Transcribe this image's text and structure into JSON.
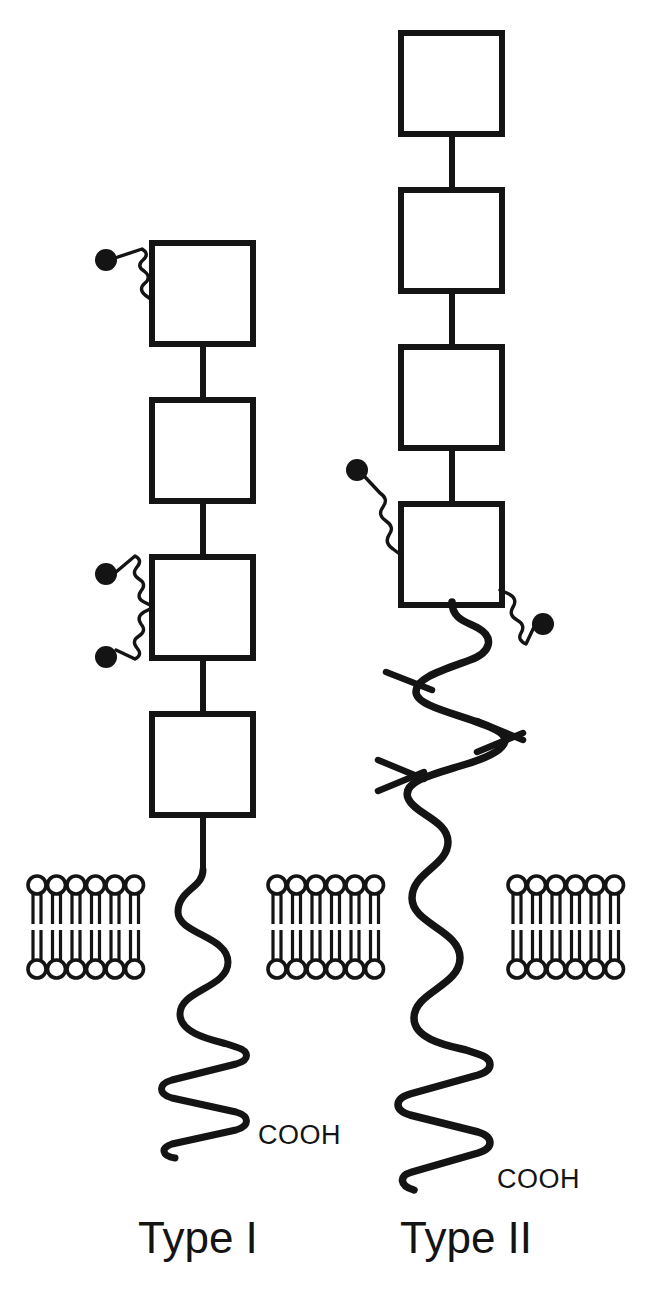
{
  "figure": {
    "background": "#ffffff",
    "ink_color": "#141414"
  },
  "labels": {
    "type_one": "Type I",
    "type_two": "Type II",
    "cooh_one": "COOH",
    "cooh_two": "COOH"
  },
  "label_positions": {
    "type_one": {
      "x": 138,
      "y": 1253
    },
    "type_two": {
      "x": 400,
      "y": 1253
    },
    "cooh_one": {
      "x": 258,
      "y": 1144
    },
    "cooh_two": {
      "x": 497,
      "y": 1188
    }
  },
  "membranes": [
    {
      "name": "membrane-left",
      "x": 28,
      "y": 876,
      "lipid_count": 6
    },
    {
      "name": "membrane-middle",
      "x": 268,
      "y": 876,
      "lipid_count": 6
    },
    {
      "name": "membrane-right",
      "x": 508,
      "y": 876,
      "lipid_count": 6
    }
  ],
  "membrane_geometry": {
    "head_radius": 9,
    "lipid_pitch": 19.5,
    "leaflet_height": 48,
    "gap": 6
  },
  "type_one": {
    "center_x": 203,
    "domains": [
      {
        "index": 1,
        "x": 152,
        "y": 243,
        "w": 101,
        "h": 101
      },
      {
        "index": 2,
        "x": 152,
        "y": 400,
        "w": 101,
        "h": 101
      },
      {
        "index": 3,
        "x": 152,
        "y": 557,
        "w": 101,
        "h": 101
      },
      {
        "index": 4,
        "x": 152,
        "y": 714,
        "w": 101,
        "h": 101
      }
    ],
    "glycans": [
      {
        "name": "glycan-domain1",
        "attach_x": 152,
        "attach_y": 298,
        "dot_x": 104,
        "dot_y": 258
      },
      {
        "name": "glycan-domain3-upper",
        "attach_x": 152,
        "attach_y": 605,
        "dot_x": 104,
        "dot_y": 572
      },
      {
        "name": "glycan-domain3-lower",
        "attach_x": 152,
        "attach_y": 607,
        "dot_x": 104,
        "dot_y": 657
      }
    ]
  },
  "type_two": {
    "center_x": 452,
    "domains": [
      {
        "index": 1,
        "x": 401,
        "y": 33,
        "w": 101,
        "h": 101
      },
      {
        "index": 2,
        "x": 401,
        "y": 190,
        "w": 101,
        "h": 101
      },
      {
        "index": 3,
        "x": 401,
        "y": 347,
        "w": 101,
        "h": 101
      },
      {
        "index": 4,
        "x": 401,
        "y": 504,
        "w": 101,
        "h": 101
      }
    ],
    "glycans": [
      {
        "name": "glycan-domain4-left",
        "attach_x": 401,
        "attach_y": 555,
        "dot_x": 354,
        "dot_y": 470
      },
      {
        "name": "glycan-domain4-right",
        "attach_x": 502,
        "attach_y": 593,
        "dot_x": 543,
        "dot_y": 624
      }
    ],
    "coil_crossovers": [
      {
        "name": "crossover-upper",
        "x": 425,
        "y": 684
      },
      {
        "name": "crossover-middle",
        "x": 515,
        "y": 737
      },
      {
        "name": "crossover-lower",
        "x": 412,
        "y": 772
      }
    ]
  }
}
